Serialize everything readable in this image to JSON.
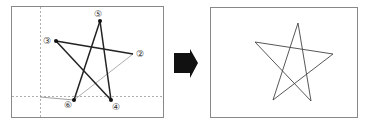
{
  "left_panel": {
    "labels": {
      "p2": "②",
      "p3": "③",
      "p4": "④",
      "p5": "⑤",
      "p6": "⑥"
    }
  },
  "arrow": {
    "color": "#111111"
  },
  "colors": {
    "border": "#888888",
    "line_thick": "#222222",
    "line_thin": "#888888",
    "guide": "#999999"
  }
}
